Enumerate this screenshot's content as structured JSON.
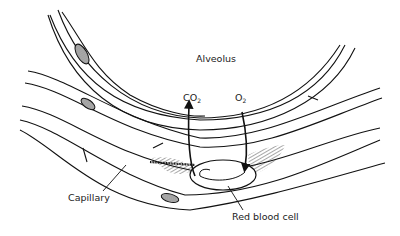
{
  "diagram": {
    "labels": {
      "alveolus": "Alveolus",
      "co2_base": "CO",
      "co2_sub": "2",
      "o2_base": "O",
      "o2_sub": "2",
      "capillary": "Capillary",
      "red_blood_cell": "Red blood cell"
    },
    "arrows": [
      {
        "name": "co2-arrow",
        "direction": "out-of-blood-into-alveolus"
      },
      {
        "name": "o2-arrow",
        "direction": "into-blood-from-alveolus"
      }
    ],
    "colors": {
      "line": "#111111",
      "background": "#ffffff",
      "text": "#222222"
    }
  }
}
